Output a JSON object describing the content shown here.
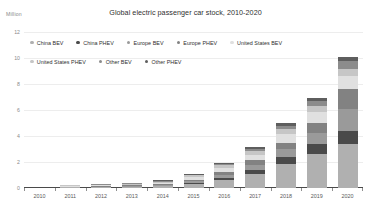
{
  "chart_data": {
    "type": "bar",
    "stacked": true,
    "title": "Global electric passenger car stock, 2010-2020",
    "unit_label": "Million",
    "xlabel": "",
    "ylabel": "",
    "ylim": [
      0,
      12
    ],
    "yticks": [
      0,
      2,
      4,
      6,
      8,
      10,
      12
    ],
    "grid": true,
    "legend_position": "top",
    "categories": [
      "2010",
      "2011",
      "2012",
      "2013",
      "2014",
      "2015",
      "2016",
      "2017",
      "2018",
      "2019",
      "2020"
    ],
    "series": [
      {
        "name": "China BEV",
        "color": "#b0b0b0",
        "values": [
          0.0,
          0.01,
          0.02,
          0.04,
          0.12,
          0.28,
          0.58,
          1.06,
          1.84,
          2.62,
          3.4
        ]
      },
      {
        "name": "China PHEV",
        "color": "#4a4a4a",
        "values": [
          0.0,
          0.0,
          0.0,
          0.01,
          0.03,
          0.08,
          0.2,
          0.35,
          0.55,
          0.75,
          0.95
        ]
      },
      {
        "name": "Europe BEV",
        "color": "#9a9a9a",
        "values": [
          0.0,
          0.01,
          0.02,
          0.04,
          0.08,
          0.15,
          0.25,
          0.38,
          0.58,
          0.9,
          1.75
        ]
      },
      {
        "name": "Europe PHEV",
        "color": "#828282",
        "values": [
          0.0,
          0.0,
          0.01,
          0.02,
          0.05,
          0.12,
          0.22,
          0.33,
          0.48,
          0.7,
          1.55
        ]
      },
      {
        "name": "United States BEV",
        "color": "#e0e0e0",
        "values": [
          0.0,
          0.01,
          0.02,
          0.05,
          0.11,
          0.2,
          0.3,
          0.43,
          0.68,
          0.85,
          0.98
        ]
      },
      {
        "name": "United States PHEV",
        "color": "#c6c6c6",
        "values": [
          0.0,
          0.01,
          0.02,
          0.04,
          0.08,
          0.14,
          0.21,
          0.29,
          0.42,
          0.5,
          0.55
        ]
      },
      {
        "name": "Other BEV",
        "color": "#8c8c8c",
        "values": [
          0.0,
          0.0,
          0.01,
          0.02,
          0.04,
          0.07,
          0.12,
          0.18,
          0.26,
          0.38,
          0.58
        ]
      },
      {
        "name": "Other PHEV",
        "color": "#5e5e5e",
        "values": [
          0.0,
          0.0,
          0.0,
          0.01,
          0.02,
          0.04,
          0.07,
          0.11,
          0.16,
          0.22,
          0.32
        ]
      }
    ],
    "totals": [
      0.0,
      0.04,
      0.1,
      0.23,
      0.53,
      1.08,
      1.95,
      3.13,
      4.97,
      6.92,
      10.08
    ]
  }
}
